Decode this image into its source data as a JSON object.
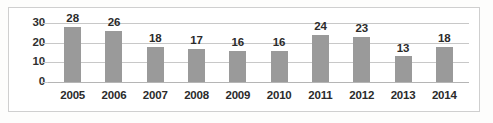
{
  "chart_data": {
    "type": "bar",
    "title": "",
    "subtitle": "",
    "xlabel": "",
    "ylabel": "",
    "categories": [
      "2005",
      "2006",
      "2007",
      "2008",
      "2009",
      "2010",
      "2011",
      "2012",
      "2013",
      "2014"
    ],
    "values": [
      28,
      26,
      18,
      17,
      16,
      16,
      24,
      23,
      13,
      18
    ],
    "data_labels": [
      "28",
      "26",
      "18",
      "17",
      "16",
      "16",
      "24",
      "23",
      "13",
      "18"
    ],
    "ylim": [
      0,
      30
    ],
    "yticks": [
      0,
      10,
      20,
      30
    ],
    "ytick_labels": [
      "0",
      "10",
      "20",
      "30"
    ],
    "grid": true,
    "legend": false,
    "legend_position": "none",
    "series": [
      {
        "name": "",
        "values": [
          28,
          26,
          18,
          17,
          16,
          16,
          24,
          23,
          13,
          18
        ],
        "color": "#9a9a9a"
      }
    ],
    "colors": {
      "bar": "#9a9a9a",
      "gridline": "#c8c8c8",
      "axis_line": "#b5b5b5",
      "border": "#cfcfcf",
      "text": "#2b2b2b",
      "background": "#ffffff"
    }
  }
}
